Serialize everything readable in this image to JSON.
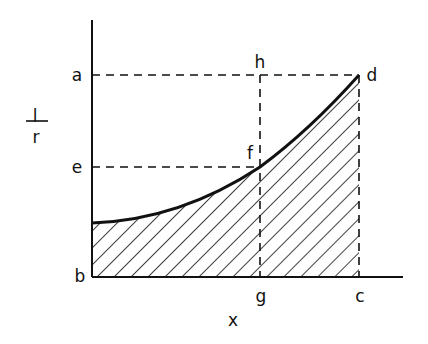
{
  "diagram": {
    "y_axis_label": {
      "numerator": "l",
      "denominator": "r"
    },
    "x_axis_label": "x",
    "point_labels": {
      "a": "a",
      "b": "b",
      "c": "c",
      "d": "d",
      "e": "e",
      "f": "f",
      "g": "g",
      "h": "h"
    },
    "colors": {
      "ink": "#111111",
      "background": "#ffffff"
    },
    "hatch": "diagonal lines under curve from b to c"
  }
}
